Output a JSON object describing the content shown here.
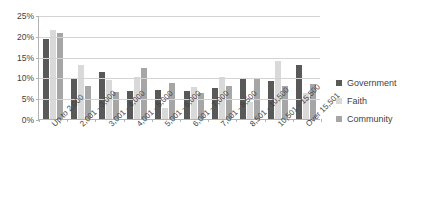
{
  "chart_data": {
    "type": "bar",
    "title": "",
    "subtitle": "",
    "xlabel": "",
    "ylabel": "",
    "ylim": [
      0,
      25
    ],
    "ytick_labels": [
      "0%",
      "5%",
      "10%",
      "15%",
      "20%",
      "25%"
    ],
    "ytick_values": [
      0,
      5,
      10,
      15,
      20,
      25
    ],
    "grid": true,
    "legend_position": "right",
    "categories": [
      "Up to 2,000",
      "2,001 - 3,000",
      "3,001 - 4,000",
      "4,001 - 5,000",
      "5,001 - 6,000",
      "6,001 - 7,000",
      "7,001 - 8,500",
      "8,501 - 10,500",
      "10,501 - 15,500",
      "Over 15,501"
    ],
    "series": [
      {
        "name": "Government",
        "color": "#595959",
        "values": [
          19.3,
          9.9,
          11.2,
          6.8,
          6.9,
          6.8,
          7.4,
          9.9,
          9.1,
          12.9
        ]
      },
      {
        "name": "Faith",
        "color": "#d9d9d9",
        "values": [
          21.5,
          13.0,
          9.3,
          10.2,
          2.6,
          7.8,
          10.0,
          4.0,
          14.0,
          6.2
        ]
      },
      {
        "name": "Community",
        "color": "#a6a6a6",
        "values": [
          20.6,
          8.0,
          6.4,
          12.2,
          8.6,
          6.2,
          8.0,
          9.6,
          7.9,
          8.5
        ]
      }
    ]
  },
  "legend": {
    "items": [
      {
        "label": "Government",
        "color": "#595959"
      },
      {
        "label": "Faith",
        "color": "#d9d9d9"
      },
      {
        "label": "Community",
        "color": "#a6a6a6"
      }
    ]
  }
}
